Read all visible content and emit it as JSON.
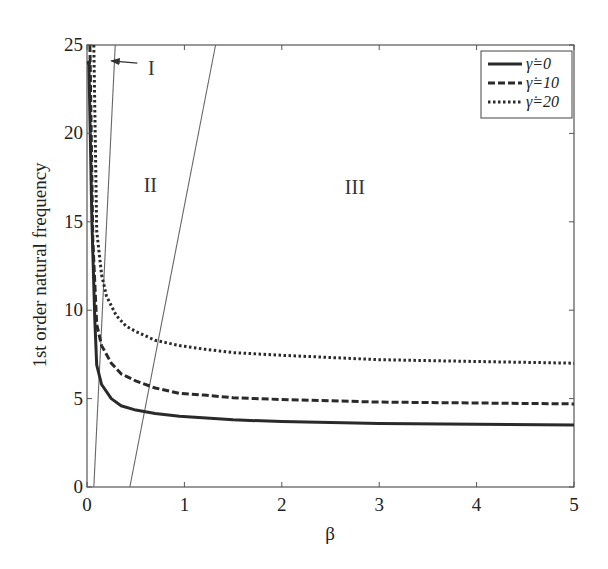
{
  "chart_data": {
    "type": "line",
    "title": "",
    "xlabel": "β",
    "ylabel": "1st order natural frequency",
    "xlim": [
      0,
      5
    ],
    "ylim": [
      0,
      25
    ],
    "xticks": [
      0,
      1,
      2,
      3,
      4,
      5
    ],
    "yticks": [
      0,
      5,
      10,
      15,
      20,
      25
    ],
    "grid": false,
    "legend_position": "upper right",
    "series": [
      {
        "name": "γ̇=0",
        "style": "solid",
        "x": [
          0.02,
          0.05,
          0.08,
          0.1,
          0.15,
          0.25,
          0.35,
          0.5,
          0.7,
          0.95,
          1.5,
          2.0,
          3.0,
          4.0,
          5.0
        ],
        "y": [
          24.0,
          15.0,
          9.5,
          6.9,
          5.8,
          5.0,
          4.6,
          4.35,
          4.15,
          4.0,
          3.8,
          3.7,
          3.6,
          3.55,
          3.5
        ]
      },
      {
        "name": "γ̇=10",
        "style": "dashed",
        "x": [
          0.03,
          0.06,
          0.1,
          0.15,
          0.25,
          0.35,
          0.5,
          0.7,
          0.95,
          1.2,
          1.5,
          2.0,
          3.0,
          4.0,
          5.0
        ],
        "y": [
          25.0,
          14.0,
          9.2,
          8.0,
          7.0,
          6.4,
          6.0,
          5.6,
          5.3,
          5.2,
          5.05,
          4.95,
          4.8,
          4.75,
          4.7
        ]
      },
      {
        "name": "γ̇=20",
        "style": "dotted",
        "x": [
          0.07,
          0.1,
          0.15,
          0.2,
          0.3,
          0.4,
          0.5,
          0.7,
          0.95,
          1.2,
          1.5,
          2.0,
          3.0,
          4.0,
          5.0
        ],
        "y": [
          25.0,
          14.5,
          12.0,
          10.8,
          9.7,
          9.1,
          8.8,
          8.3,
          8.0,
          7.8,
          7.6,
          7.45,
          7.2,
          7.1,
          7.0
        ]
      }
    ],
    "boundary_lines": [
      {
        "name": "boundary-I-II",
        "x": [
          0.07,
          0.29
        ],
        "y": [
          0,
          25
        ]
      },
      {
        "name": "boundary-II-III",
        "x": [
          0.44,
          1.32
        ],
        "y": [
          0,
          25
        ]
      }
    ],
    "annotations": [
      {
        "text": "I",
        "x": 0.66,
        "y": 23.3,
        "arrow_to": [
          0.25,
          24.1
        ]
      },
      {
        "text": "II",
        "x": 0.65,
        "y": 16.7
      },
      {
        "text": "III",
        "x": 2.75,
        "y": 16.6
      }
    ]
  },
  "legend": {
    "items": [
      {
        "label": "γ̇=0",
        "style": "solid"
      },
      {
        "label": "γ̇=10",
        "style": "dashed"
      },
      {
        "label": "γ̇=20",
        "style": "dotted"
      }
    ]
  }
}
